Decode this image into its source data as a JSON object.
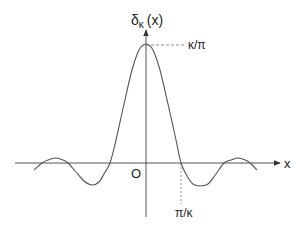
{
  "diagram": {
    "type": "function-plot",
    "y_axis_label": {
      "main": "δ",
      "subscript": "κ",
      "arg": "(x)"
    },
    "x_axis_label": "x",
    "origin_label": "O",
    "peak_label": "κ/π",
    "zero_label": "π/κ",
    "colors": {
      "curve": "#555555",
      "axis": "#555555",
      "dashed": "#777777",
      "text": "#222222"
    },
    "curve_points": [
      [
        34,
        170
      ],
      [
        42,
        163
      ],
      [
        48,
        160
      ],
      [
        56,
        158
      ],
      [
        63,
        160
      ],
      [
        68,
        163
      ],
      [
        76,
        172
      ],
      [
        84,
        181
      ],
      [
        92,
        185
      ],
      [
        99,
        182
      ],
      [
        104,
        174
      ],
      [
        110,
        163
      ],
      [
        116,
        140
      ],
      [
        124,
        104
      ],
      [
        132,
        70
      ],
      [
        138,
        52
      ],
      [
        142,
        46
      ],
      [
        146,
        44
      ],
      [
        150,
        46
      ],
      [
        154,
        52
      ],
      [
        160,
        70
      ],
      [
        168,
        104
      ],
      [
        176,
        140
      ],
      [
        181,
        163
      ],
      [
        187,
        176
      ],
      [
        193,
        184
      ],
      [
        200,
        186
      ],
      [
        208,
        184
      ],
      [
        216,
        174
      ],
      [
        224,
        163
      ],
      [
        231,
        160
      ],
      [
        238,
        158
      ],
      [
        245,
        160
      ],
      [
        250,
        163
      ],
      [
        257,
        170
      ]
    ]
  }
}
